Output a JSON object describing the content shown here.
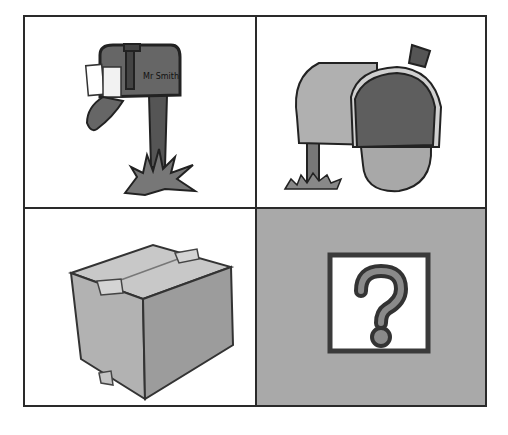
{
  "grid": {
    "cells": [
      {
        "id": "mailbox-flag-up",
        "icon": "mailbox-with-letters-icon",
        "label": "",
        "mailbox_text": "Mr Smith"
      },
      {
        "id": "mailbox-open",
        "icon": "open-mailbox-icon",
        "label": ""
      },
      {
        "id": "package",
        "icon": "cardboard-box-icon",
        "label": ""
      },
      {
        "id": "unknown",
        "icon": "question-mark-icon",
        "label": "?"
      }
    ]
  },
  "colors": {
    "border": "#2a2a2a",
    "cell_bg": "#ffffff",
    "highlight_cell_bg": "#a9a9a9",
    "dark_gray": "#555555",
    "mid_gray": "#8a8a8a",
    "light_gray": "#b8b8b8"
  }
}
